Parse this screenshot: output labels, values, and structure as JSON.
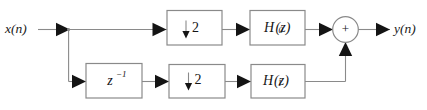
{
  "diagram": {
    "type": "signal-flow-block-diagram",
    "colors": {
      "background": "#ffffff",
      "box_border": "#8a8a8a",
      "wire": "#8a8a8a",
      "arrow_fill": "#141414",
      "text": "#141414"
    },
    "input": {
      "label": "x(n)"
    },
    "output": {
      "label": "y(n)"
    },
    "branches": [
      {
        "name": "upper-branch",
        "blocks": [
          {
            "id": "downsampler-top",
            "kind": "downsampler",
            "arrow": "↓",
            "factor": "2"
          },
          {
            "id": "filter-h0",
            "kind": "filter",
            "base": "H",
            "subscript": "0",
            "arg": "(z)",
            "full": "H0(z)"
          }
        ]
      },
      {
        "name": "lower-branch",
        "blocks": [
          {
            "id": "delay",
            "kind": "delay",
            "base": "z",
            "exponent": "−1",
            "full": "z⁻¹"
          },
          {
            "id": "downsampler-bottom",
            "kind": "downsampler",
            "arrow": "↓",
            "factor": "2"
          },
          {
            "id": "filter-h1",
            "kind": "filter",
            "base": "H",
            "subscript": "1",
            "arg": "(z)",
            "full": "H1(z)"
          }
        ]
      }
    ],
    "adder": {
      "id": "summing-junction",
      "sign": "+"
    }
  }
}
